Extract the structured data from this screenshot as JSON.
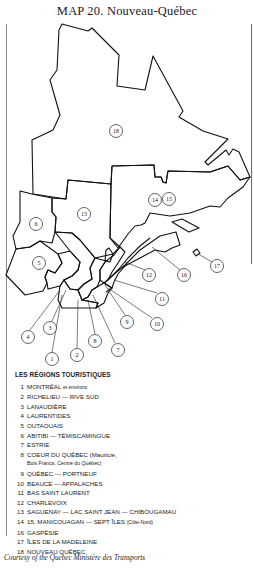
{
  "title": "MAP 20.  Nouveau-Québec",
  "map": {
    "region_labels": [
      {
        "id": "1",
        "x": 52,
        "y": 359
      },
      {
        "id": "2",
        "x": 77,
        "y": 355
      },
      {
        "id": "3",
        "x": 50,
        "y": 328
      },
      {
        "id": "4",
        "x": 28,
        "y": 337
      },
      {
        "id": "5",
        "x": 39,
        "y": 263
      },
      {
        "id": "6",
        "x": 36,
        "y": 224
      },
      {
        "id": "7",
        "x": 118,
        "y": 350
      },
      {
        "id": "8",
        "x": 95,
        "y": 341
      },
      {
        "id": "9",
        "x": 127,
        "y": 322
      },
      {
        "id": "10",
        "x": 157,
        "y": 324
      },
      {
        "id": "11",
        "x": 162,
        "y": 299
      },
      {
        "id": "12",
        "x": 149,
        "y": 275
      },
      {
        "id": "13",
        "x": 84,
        "y": 214
      },
      {
        "id": "14",
        "x": 155,
        "y": 200
      },
      {
        "id": "15",
        "x": 169,
        "y": 199
      },
      {
        "id": "16",
        "x": 184,
        "y": 275
      },
      {
        "id": "17",
        "x": 217,
        "y": 266
      },
      {
        "id": "18",
        "x": 116,
        "y": 131
      }
    ]
  },
  "legend": {
    "title": "LES RÉGIONS TOURISTIQUES",
    "items": [
      {
        "num": "1",
        "label": "MONTRÉAL",
        "sub": "et environs"
      },
      {
        "num": "2",
        "label": "RICHELIEU — RIVE SUD"
      },
      {
        "num": "3",
        "label": "LANAUDIÈRE"
      },
      {
        "num": "4",
        "label": "LAURENTIDES"
      },
      {
        "num": "5",
        "label": "OUTAOUAIS"
      },
      {
        "num": "6",
        "label": "ABITIBI — TÉMISCAMINGUE"
      },
      {
        "num": "7",
        "label": "ESTRIE"
      },
      {
        "num": "8",
        "label": "COEUR DU QUÉBEC (Mauricie,",
        "cont": "Bois Francs, Centre du Québec)"
      },
      {
        "num": "9",
        "label": "QUÉBEC — PORTNEUF"
      },
      {
        "num": "10",
        "label": "BEAUCE — APPALACHES"
      },
      {
        "num": "11",
        "label": "BAS SAINT LAURENT"
      },
      {
        "num": "12",
        "label": "CHARLEVOIX"
      },
      {
        "num": "13",
        "label": "SAGUENAY — LAC SAINT JEAN — CHIBOUGAMAU"
      },
      {
        "num": "14",
        "label": "15. MANICOUAGAN — SEPT ÎLES",
        "sub": "(Côte-Nord)"
      },
      {
        "num": "16",
        "label": "GASPÉSIE"
      },
      {
        "num": "17",
        "label": "ÎLES DE LA MADELEINE"
      },
      {
        "num": "18",
        "label": "NOUVEAU QUÉBEC"
      }
    ]
  },
  "caption": "Courtesy of the Quebec Ministère des Transports"
}
